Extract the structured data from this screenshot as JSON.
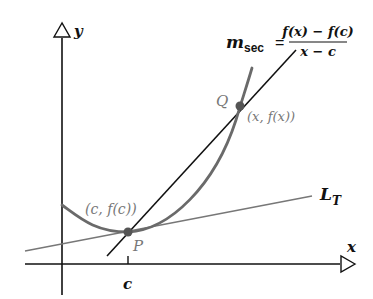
{
  "diagram": {
    "axes": {
      "x_label": "x",
      "y_label": "y",
      "x_tick_label": "c"
    },
    "points": {
      "P": {
        "name": "P",
        "coord_label": "(c, f(c))"
      },
      "Q": {
        "name": "Q",
        "coord_label": "(x, f(x))"
      }
    },
    "tangent_line": {
      "label_main": "L",
      "label_sub": "T"
    },
    "secant_formula": {
      "lhs_main": "m",
      "lhs_sub": "sec",
      "equals": "=",
      "numerator": "f(x) − f(c)",
      "denominator": "x − c"
    },
    "colors": {
      "curve": "#6a6a6a",
      "secant": "#111111",
      "tangent": "#777777",
      "axes": "#111111",
      "points": "#555555",
      "point_labels": "#777777"
    }
  }
}
